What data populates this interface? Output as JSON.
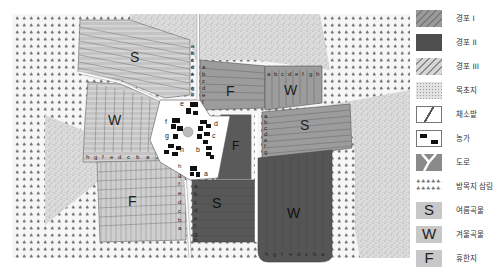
{
  "legend": {
    "items": [
      {
        "key": "field1",
        "label": "경포 I",
        "swatch_color": "#9a9a9a",
        "icon": "diagonal-hatch-light-icon"
      },
      {
        "key": "field2",
        "label": "경포 II",
        "swatch_color": "#4e4e4e",
        "icon": "diagonal-hatch-dark-icon"
      },
      {
        "key": "field3",
        "label": "경포 III",
        "swatch_color": "#cfcfcf",
        "icon": "diagonal-hatch-pale-icon"
      },
      {
        "key": "pasture",
        "label": "목초지",
        "swatch_color": "#d8d8d8",
        "icon": "speckle-icon"
      },
      {
        "key": "vegetable",
        "label": "채소밭",
        "swatch_color": "#ffffff",
        "icon": "slash-box-icon"
      },
      {
        "key": "farmhouse",
        "label": "농가",
        "swatch_color": "#ffffff",
        "icon": "farmhouse-icon"
      },
      {
        "key": "road",
        "label": "도로",
        "swatch_color": "#8a8a8a",
        "icon": "road-fork-icon"
      },
      {
        "key": "forest",
        "label": "방목지 삼림",
        "swatch_color": "#ffffff",
        "icon": "tree-pattern-icon"
      },
      {
        "key": "summer",
        "label": "여름곡물",
        "letter": "S",
        "swatch_color": "#bdbdbd"
      },
      {
        "key": "winter",
        "label": "겨울곡물",
        "letter": "W",
        "swatch_color": "#bdbdbd"
      },
      {
        "key": "fallow",
        "label": "휴한지",
        "letter": "F",
        "swatch_color": "#bdbdbd"
      }
    ]
  },
  "map": {
    "colors": {
      "field1": "#9c9c9c",
      "field2": "#575757",
      "field3": "#cdcdcd",
      "pasture": "#d9d9d9",
      "forest_bg": "#f4f4f4",
      "village": "#ffffff",
      "house": "#111111",
      "road": "#ffffff"
    },
    "fields": [
      {
        "id": "north-west-S",
        "crop_letter": "S",
        "strip_labels": [
          "a",
          "b",
          "c",
          "d",
          "e",
          "f",
          "g",
          "h"
        ]
      },
      {
        "id": "west-W",
        "crop_letter": "W",
        "strip_labels": [
          "h",
          "g",
          "f",
          "e",
          "d",
          "c",
          "b",
          "a"
        ]
      },
      {
        "id": "south-west-F",
        "crop_letter": "F",
        "strip_labels": [
          "h",
          "g",
          "f",
          "e",
          "d",
          "c",
          "b",
          "a"
        ]
      },
      {
        "id": "north-F",
        "crop_letter": "F",
        "strip_labels": [
          "a",
          "b",
          "c",
          "d",
          "e",
          "f",
          "g",
          "h"
        ]
      },
      {
        "id": "north-east-W",
        "crop_letter": "W",
        "strip_labels": [
          "a",
          "b",
          "c",
          "d",
          "e",
          "f",
          "g",
          "h"
        ]
      },
      {
        "id": "east-S",
        "crop_letter": "S",
        "strip_labels": [
          "a",
          "b",
          "c",
          "d",
          "e",
          "f",
          "g",
          "h"
        ]
      },
      {
        "id": "center-F",
        "crop_letter": "F",
        "strip_labels": [
          "a",
          "h",
          "f",
          "g",
          "h"
        ]
      },
      {
        "id": "south-S",
        "crop_letter": "S",
        "strip_labels": [
          "a",
          "b",
          "c",
          "d",
          "e",
          "f",
          "g",
          "h"
        ]
      },
      {
        "id": "south-east-W",
        "crop_letter": "W",
        "strip_labels": [
          "h",
          "g",
          "f",
          "e",
          "d",
          "c",
          "b",
          "a"
        ]
      }
    ],
    "farm_labels": [
      "a",
      "b",
      "c",
      "d",
      "e",
      "f",
      "g",
      "h"
    ]
  }
}
